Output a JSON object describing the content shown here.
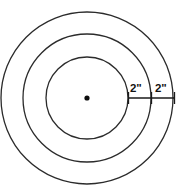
{
  "figure": {
    "background_color": "#ffffff",
    "stroke_color": "#2b2b2b",
    "label_color": "#121212",
    "width": 179,
    "height": 189
  },
  "center_point": {
    "name": "center",
    "x": 87,
    "y": 98,
    "dot_radius": 2.6,
    "color": "#0d0d0d"
  },
  "circles": [
    {
      "name": "inner-circle",
      "cx": 87,
      "cy": 98,
      "r": 41,
      "stroke_width": 1.3
    },
    {
      "name": "middle-circle",
      "cx": 87,
      "cy": 98,
      "r": 64,
      "stroke_width": 1.3
    },
    {
      "name": "outer-circle",
      "cx": 87,
      "cy": 98,
      "r": 86,
      "stroke_width": 1.3
    }
  ],
  "measurement_line": {
    "name": "radial-measurement-line",
    "y": 98,
    "x_start": 128,
    "x_mid": 151,
    "x_end": 174,
    "tick_top": 92,
    "tick_bottom": 104
  },
  "labels": {
    "inner_gap": "2\"",
    "outer_gap": "2\""
  },
  "chart_data": {
    "type": "diagram",
    "shape": "concentric-circles",
    "ring_count": 3,
    "center": [
      87,
      98
    ],
    "radii_px": [
      41,
      64,
      86
    ],
    "annotations": [
      {
        "label": "2\"",
        "describes": "radial width between inner circle and middle circle",
        "value": 2,
        "unit": "inch"
      },
      {
        "label": "2\"",
        "describes": "radial width between middle circle and outer circle",
        "value": 2,
        "unit": "inch"
      }
    ]
  }
}
